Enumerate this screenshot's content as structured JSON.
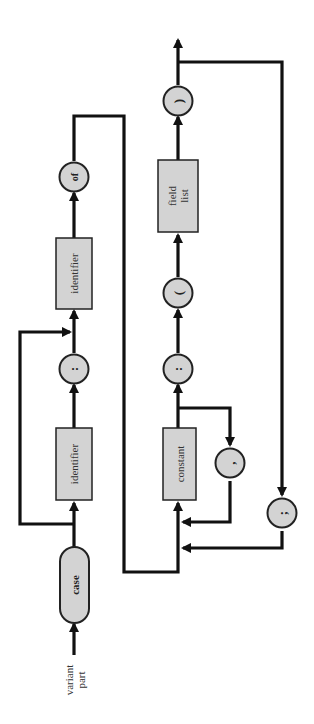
{
  "diagram": {
    "title": "variant part",
    "entry_label_line1": "variant",
    "entry_label_line2": "part",
    "colors": {
      "line": "#111111",
      "node_fill": "#d3d3d3",
      "node_stroke": "#222222",
      "background": "#ffffff"
    },
    "orientation": "rotated 90deg counter-clockwise (flow bottom-to-top)",
    "nodes": {
      "case": {
        "type": "terminal",
        "label": "case"
      },
      "identifier1": {
        "type": "non-terminal",
        "label": "identifier"
      },
      "colon1": {
        "type": "terminal",
        "label": ":"
      },
      "identifier2": {
        "type": "non-terminal",
        "label": "identifier"
      },
      "of": {
        "type": "terminal",
        "label": "of"
      },
      "constant": {
        "type": "non-terminal",
        "label": "constant"
      },
      "comma": {
        "type": "terminal",
        "label": ","
      },
      "colon2": {
        "type": "terminal",
        "label": ":"
      },
      "lparen": {
        "type": "terminal",
        "label": "("
      },
      "field_list": {
        "type": "non-terminal",
        "label_line1": "field",
        "label_line2": "list"
      },
      "rparen": {
        "type": "terminal",
        "label": ")"
      },
      "semicolon": {
        "type": "terminal",
        "label": ";"
      }
    },
    "edges": [
      [
        "entry",
        "case"
      ],
      [
        "case",
        "identifier1"
      ],
      [
        "case",
        "identifier2 (bypass)"
      ],
      [
        "identifier1",
        "colon1"
      ],
      [
        "colon1",
        "identifier2"
      ],
      [
        "identifier2",
        "of"
      ],
      [
        "of",
        "constant"
      ],
      [
        "constant",
        "colon2"
      ],
      [
        "constant",
        "comma"
      ],
      [
        "comma",
        "constant"
      ],
      [
        "colon2",
        "lparen"
      ],
      [
        "lparen",
        "field_list"
      ],
      [
        "field_list",
        "rparen"
      ],
      [
        "rparen",
        "exit"
      ],
      [
        "rparen",
        "semicolon"
      ],
      [
        "semicolon",
        "constant"
      ]
    ]
  }
}
